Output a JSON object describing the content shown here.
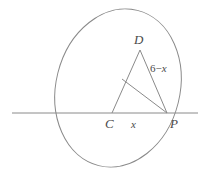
{
  "figure": {
    "stroke_color": "#8a8a8a",
    "label_color": "#4a4a4a",
    "background_color": "#ffffff",
    "labels": {
      "apex": "D",
      "center": "C",
      "tangent_point": "P",
      "segment_cp": "x",
      "segment_dp_number": "6",
      "segment_dp_operator": "−",
      "segment_dp_variable": "x"
    },
    "geometry": {
      "ellipse": {
        "cx": 118,
        "cy": 88,
        "rx": 62,
        "ry": 80,
        "rotation_deg": 14
      },
      "secant_line": {
        "x1": 12,
        "y1": 113,
        "x2": 198,
        "y2": 113
      },
      "points": {
        "C": {
          "x": 112,
          "y": 113
        },
        "D": {
          "x": 140,
          "y": 50
        },
        "P": {
          "x": 167,
          "y": 113
        },
        "M": {
          "x": 122,
          "y": 79
        }
      },
      "segments": [
        {
          "name": "C-D",
          "from": "C",
          "to": "D"
        },
        {
          "name": "D-P",
          "from": "D",
          "to": "P"
        },
        {
          "name": "M-P",
          "from": "M",
          "to": "P"
        }
      ]
    }
  }
}
